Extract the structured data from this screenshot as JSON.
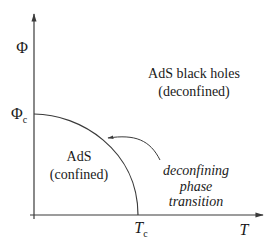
{
  "diagram": {
    "title": "",
    "type": "phase_diagram",
    "axes": {
      "y": {
        "label": "Φ",
        "tick_label_base": "Φ",
        "tick_label_sub": "c"
      },
      "x": {
        "label": "T",
        "tick_label_base": "T",
        "tick_label_sub": "c"
      }
    },
    "regions": {
      "deconfined": {
        "line1": "AdS black holes",
        "line2": "(deconfined)"
      },
      "confined": {
        "line1": "AdS",
        "line2": "(confined)"
      }
    },
    "annotation": {
      "line1": "deconfining",
      "line2": "phase",
      "line3": "transition"
    },
    "colors": {
      "line": "#3a3a3a",
      "text": "#1a1a1a",
      "background": "#ffffff"
    }
  }
}
